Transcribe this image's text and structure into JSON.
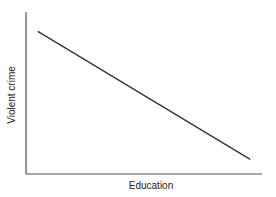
{
  "chart_data": {
    "type": "line",
    "title": "",
    "xlabel": "Education",
    "ylabel": "Violent crime",
    "grid": false,
    "legend": null,
    "x_ticks": [],
    "y_ticks": [],
    "xlim": [
      0,
      1
    ],
    "ylim": [
      0,
      1
    ],
    "series": [
      {
        "name": "Violent crime vs Education",
        "x": [
          0.05,
          0.95
        ],
        "y": [
          0.88,
          0.09
        ]
      }
    ],
    "annotations": []
  },
  "colors": {
    "line": "#333333",
    "axes": "#555555",
    "text": "#222222",
    "background": "#ffffff"
  }
}
